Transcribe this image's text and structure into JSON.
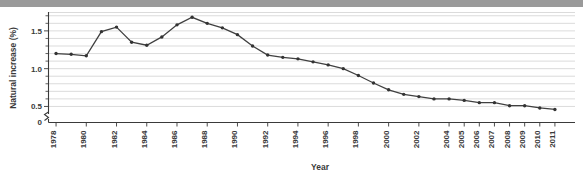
{
  "chart_data": {
    "type": "line",
    "title": "",
    "xlabel": "Year",
    "ylabel": "Natural increase (%)",
    "x": [
      1978,
      1979,
      1980,
      1981,
      1982,
      1983,
      1984,
      1985,
      1986,
      1987,
      1988,
      1989,
      1990,
      1991,
      1992,
      1993,
      1994,
      1995,
      1996,
      1997,
      1998,
      1999,
      2000,
      2001,
      2002,
      2003,
      2004,
      2005,
      2006,
      2007,
      2008,
      2009,
      2010,
      2011
    ],
    "values": [
      1.2,
      1.19,
      1.17,
      1.49,
      1.55,
      1.35,
      1.31,
      1.42,
      1.58,
      1.68,
      1.6,
      1.54,
      1.45,
      1.3,
      1.18,
      1.15,
      1.13,
      1.09,
      1.05,
      1.0,
      0.91,
      0.81,
      0.72,
      0.66,
      0.63,
      0.6,
      0.6,
      0.58,
      0.55,
      0.55,
      0.51,
      0.51,
      0.48,
      0.46
    ],
    "series": [
      {
        "name": "Natural increase (%)",
        "values": [
          1.2,
          1.19,
          1.17,
          1.49,
          1.55,
          1.35,
          1.31,
          1.42,
          1.58,
          1.68,
          1.6,
          1.54,
          1.45,
          1.3,
          1.18,
          1.15,
          1.13,
          1.09,
          1.05,
          1.0,
          0.91,
          0.81,
          0.72,
          0.66,
          0.63,
          0.6,
          0.6,
          0.58,
          0.55,
          0.55,
          0.51,
          0.51,
          0.48,
          0.46
        ]
      }
    ],
    "xtick_labels": [
      "1978",
      "1980",
      "1982",
      "1984",
      "1986",
      "1988",
      "1990",
      "1992",
      "1994",
      "1996",
      "1998",
      "2000",
      "2002",
      "2004",
      "2005",
      "2006",
      "2007",
      "2008",
      "2009",
      "2010",
      "2011"
    ],
    "xtick_values": [
      1978,
      1980,
      1982,
      1984,
      1986,
      1988,
      1990,
      1992,
      1994,
      1996,
      1998,
      2000,
      2002,
      2004,
      2005,
      2006,
      2007,
      2008,
      2009,
      2010,
      2011
    ],
    "ytick_labels": [
      "0",
      "0.5",
      "1.0",
      "1.5"
    ],
    "ytick_values": [
      0,
      0.5,
      1.0,
      1.5
    ],
    "yminor_step": 0.1,
    "ylim": [
      0.4,
      1.75
    ],
    "xlim": [
      1977.5,
      2011.5
    ],
    "grid": "horizontal",
    "legend": "none",
    "axis_break": "y-axis broken between 0 and 0.5",
    "line_color": "#404040",
    "marker_color": "#333333",
    "grid_color": "#d2d2d2"
  }
}
